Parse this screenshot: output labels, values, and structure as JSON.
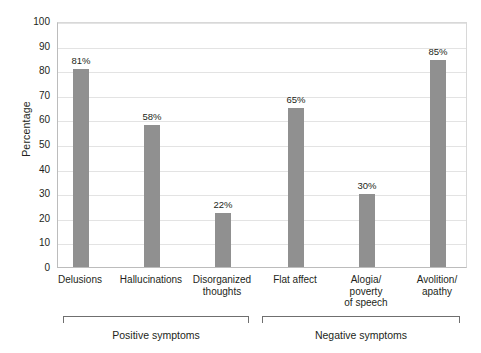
{
  "chart_data": {
    "type": "bar",
    "title": "",
    "subtitle": "",
    "xlabel": "",
    "ylabel": "Percentage",
    "ylim": [
      0,
      100
    ],
    "ytick_step": 10,
    "ytick_labels": [
      "100",
      "90",
      "80",
      "70",
      "60",
      "50",
      "40",
      "30",
      "20",
      "10",
      "0"
    ],
    "grid": true,
    "legend": false,
    "bar_color": "#909090",
    "gridline_color": "#e3e3e3",
    "axis_color": "#bcbcbc",
    "text_color": "#231f20",
    "categories": [
      "Delusions",
      "Hallucinations",
      "Disorganized\nthoughts",
      "Flat affect",
      "Alogia/\npoverty\nof speech",
      "Avolition/\napathy"
    ],
    "values": [
      81,
      58,
      22,
      65,
      30,
      85
    ],
    "value_labels": [
      "81%",
      "58%",
      "22%",
      "65%",
      "30%",
      "85%"
    ],
    "groups": [
      {
        "label": "Positive symptoms",
        "category_indices": [
          0,
          1,
          2
        ]
      },
      {
        "label": "Negative symptoms",
        "category_indices": [
          3,
          4,
          5
        ]
      }
    ]
  },
  "axis": {
    "y_title": "Percentage",
    "ticks": [
      {
        "value": "100"
      },
      {
        "value": "90"
      },
      {
        "value": "80"
      },
      {
        "value": "70"
      },
      {
        "value": "60"
      },
      {
        "value": "50"
      },
      {
        "value": "40"
      },
      {
        "value": "30"
      },
      {
        "value": "20"
      },
      {
        "value": "10"
      },
      {
        "value": "0"
      }
    ]
  },
  "bars": [
    {
      "label": "81%",
      "category_line1": "Delusions",
      "category_line2": "",
      "category_line3": ""
    },
    {
      "label": "58%",
      "category_line1": "Hallucinations",
      "category_line2": "",
      "category_line3": ""
    },
    {
      "label": "22%",
      "category_line1": "Disorganized",
      "category_line2": "thoughts",
      "category_line3": ""
    },
    {
      "label": "65%",
      "category_line1": "Flat affect",
      "category_line2": "",
      "category_line3": ""
    },
    {
      "label": "30%",
      "category_line1": "Alogia/",
      "category_line2": "poverty",
      "category_line3": "of speech"
    },
    {
      "label": "85%",
      "category_line1": "Avolition/",
      "category_line2": "apathy",
      "category_line3": ""
    }
  ],
  "groups": [
    {
      "label": "Positive symptoms"
    },
    {
      "label": "Negative symptoms"
    }
  ]
}
